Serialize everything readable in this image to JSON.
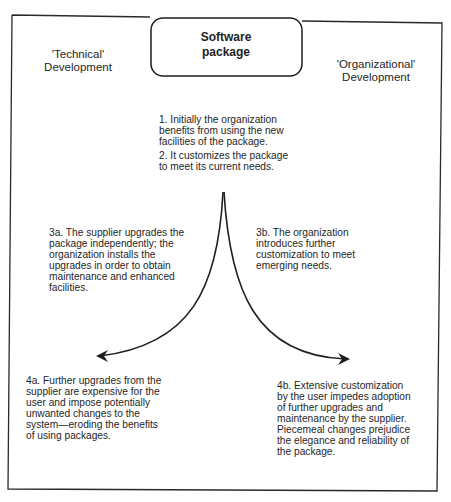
{
  "diagram": {
    "title": "Software package",
    "left_heading": "'Technical'\nDevelopment",
    "right_heading": "'Organizational'\nDevelopment",
    "steps": [
      {
        "id": "1",
        "text": "1. Initially the organization\nbenefits from using the new\nfacilities of the package."
      },
      {
        "id": "2",
        "text": "2. It customizes the package\nto meet its current needs."
      },
      {
        "id": "3a",
        "text": "3a. The supplier upgrades the\npackage independently; the\norganization installs the\nupgrades in order to obtain\nmaintenance and enhanced\nfacilities."
      },
      {
        "id": "3b",
        "text": "3b. The organization\nintroduces further\ncustomization to meet\nemerging needs."
      },
      {
        "id": "4a",
        "text": "4a. Further upgrades from the\nsupplier are expensive for the\nuser and impose potentially\nunwanted changes to the\nsystem—eroding the benefits\nof using packages."
      },
      {
        "id": "4b",
        "text": "4b. Extensive customization\nby the user impedes adoption\nof further upgrades and\nmaintenance by the supplier.\nPiecemeal changes prejudice\nthe elegance and reliability of\nthe package."
      }
    ],
    "arrows": [
      {
        "name": "technical-path",
        "from": "cusp",
        "to": "left",
        "direction": "toward 4a"
      },
      {
        "name": "organizational-path",
        "from": "cusp",
        "to": "right",
        "direction": "toward 4b"
      }
    ],
    "colors": {
      "line": "#1e1e1e",
      "text": "#262626",
      "background": "#ffffff"
    }
  }
}
